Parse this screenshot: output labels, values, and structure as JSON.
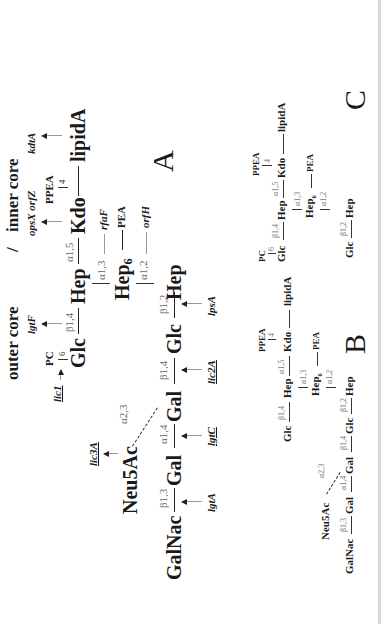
{
  "figure": {
    "orientation": "rotated-90-ccw",
    "panel_A": {
      "label": "A",
      "headers": {
        "outer": "outer core",
        "separator": "/",
        "inner": "inner core"
      },
      "main_chain": [
        "GalNac",
        "Gal",
        "Gal",
        "Glc",
        "Glc",
        "Hep"
      ],
      "main_links": [
        "β1,3",
        "α1,4",
        "β1,4",
        "β1,2"
      ],
      "branch": {
        "sugar": "Neu5Ac",
        "link": "α2,3"
      },
      "upper_chain": {
        "glc": "Glc",
        "glc_sub": "PC",
        "glc_sub_pos": "6",
        "link1": "β1,4",
        "hep": "Hep",
        "link2": "α1,5",
        "kdo": "Kdo",
        "kdo_sub": "PPEA",
        "kdo_sub_pos": "4",
        "lipid": "lipidA"
      },
      "hep6": {
        "label": "Hep",
        "subscript": "6",
        "sub": "PEA",
        "link_up": "α1,3",
        "link_down": "α1,2"
      },
      "genes": {
        "lgtA": "lgtA",
        "lgtC": "lgtC",
        "lic2A": "lic2A",
        "lpsA": "lpsA",
        "lic3A": "lic3A",
        "lic1": "lic1",
        "lgtF": "lgtF",
        "opsX_orfZ": "opsX orfZ",
        "kdtA": "kdtA",
        "rfaF": "rfaF",
        "orfH": "orfH"
      }
    },
    "panel_B": {
      "label": "B",
      "main_chain": [
        "GalNac",
        "Gal",
        "Gal",
        "Glc",
        "Hep"
      ],
      "main_links": [
        "β1,3",
        "α1,4",
        "β1,4",
        "β1,2"
      ],
      "branch": {
        "sugar": "Neu5Ac",
        "link": "α2,3"
      },
      "upper_chain": {
        "glc": "Glc",
        "link1": "β1,4",
        "hep": "Hep",
        "link2": "α1,5",
        "kdo": "Kdo",
        "kdo_sub": "PPEA",
        "kdo_sub_pos": "4",
        "lipid": "lipidA"
      },
      "hep6": {
        "label": "Hep",
        "subscript": "6",
        "sub": "PEA",
        "link_up": "α1,3",
        "link_down": "α1,2"
      }
    },
    "panel_C": {
      "label": "C",
      "lower_chain": [
        "Glc",
        "Hep"
      ],
      "lower_link": "β1,2",
      "upper_chain": {
        "glc": "Glc",
        "glc_sub": "PC",
        "glc_sub_pos": "6",
        "link1": "β1,4",
        "hep": "Hep",
        "link2": "α1,5",
        "kdo": "Kdo",
        "kdo_sub": "PPEA",
        "kdo_sub_pos": "4",
        "lipid": "lipidA"
      },
      "hep6": {
        "label": "Hep",
        "subscript": "6",
        "sub": "PEA",
        "link_up": "α1,3",
        "link_down": "α1,2"
      }
    }
  }
}
